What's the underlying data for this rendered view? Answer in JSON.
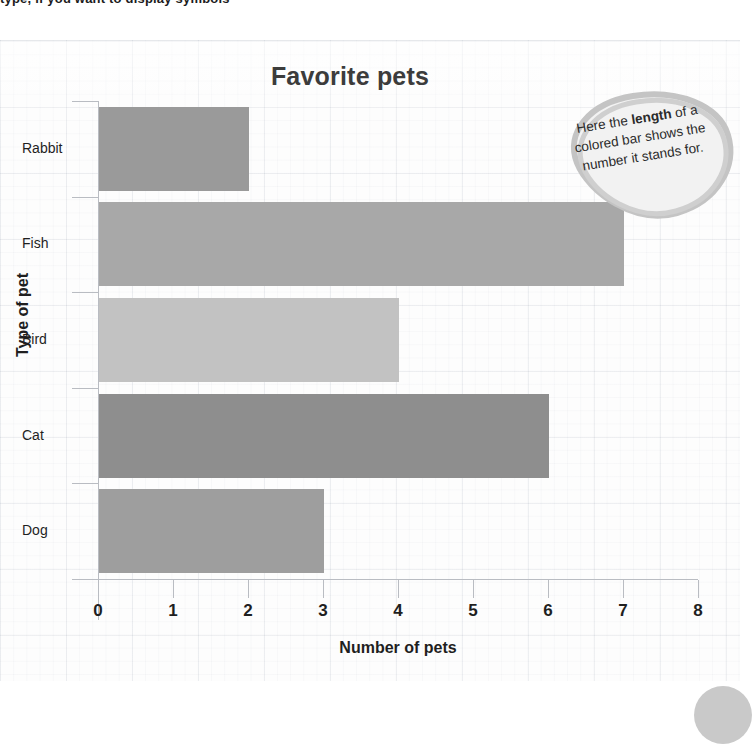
{
  "page": {
    "top_clipped_text": "type, if you want to display symbols"
  },
  "chart_data": {
    "type": "bar",
    "orientation": "horizontal",
    "title": "Favorite pets",
    "xlabel": "Number of pets",
    "ylabel": "Type of pet",
    "categories": [
      "Rabbit",
      "Fish",
      "Bird",
      "Cat",
      "Dog"
    ],
    "values": [
      2,
      7,
      4,
      6,
      3
    ],
    "bar_colors": [
      "#9a9a9a",
      "#a8a8a8",
      "#c2c2c2",
      "#8e8e8e",
      "#9e9e9e"
    ],
    "xlim": [
      0,
      8
    ],
    "xticks": [
      0,
      1,
      2,
      3,
      4,
      5,
      6,
      7,
      8
    ],
    "xtick_labels": [
      "0",
      "1",
      "2",
      "3",
      "4",
      "5",
      "6",
      "7",
      "8"
    ],
    "grid": true,
    "legend": "none"
  },
  "callout": {
    "line1_pre": "Here the ",
    "line1_bold": "length",
    "rest": " of a colored bar shows the number it stands for."
  },
  "colors": {
    "axis": "#b9bcc2",
    "text": "#1f1f1f",
    "title": "#3c3c3c",
    "callout_outline": "#bdbdbd",
    "callout_fill": "#f2f2f2",
    "corner_dot": "#c9c9c9"
  }
}
